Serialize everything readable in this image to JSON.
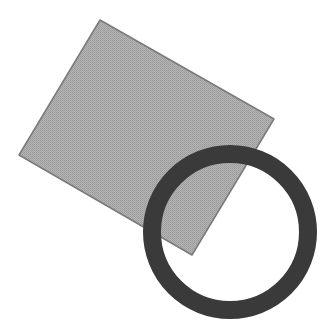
{
  "canvas": {
    "width": 330,
    "height": 334,
    "background": "#ffffff"
  },
  "shapes": {
    "square": {
      "type": "rotated-square",
      "points": [
        [
          100,
          20
        ],
        [
          274,
          119
        ],
        [
          192,
          255
        ],
        [
          19,
          155
        ]
      ],
      "fill": "#a9a9a9",
      "stroke": "#7a7a7a",
      "stroke_width": 1.5
    },
    "ring": {
      "type": "circle-outline",
      "cx": 230,
      "cy": 232,
      "r": 78,
      "fill": "none",
      "stroke": "#3a3a3a",
      "stroke_width": 18
    }
  }
}
